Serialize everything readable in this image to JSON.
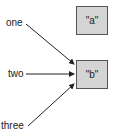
{
  "diagram": {
    "objects": [
      {
        "id": "a",
        "label": "\"a\""
      },
      {
        "id": "b",
        "label": "\"b\""
      }
    ],
    "names": [
      {
        "id": "one",
        "label": "one",
        "points_to": "b"
      },
      {
        "id": "two",
        "label": "two",
        "points_to": "b"
      },
      {
        "id": "three",
        "label": "three",
        "points_to": "b"
      }
    ],
    "colors": {
      "box_fill": "#d4d4d4",
      "box_border": "#555555",
      "arrow": "#222222"
    }
  }
}
